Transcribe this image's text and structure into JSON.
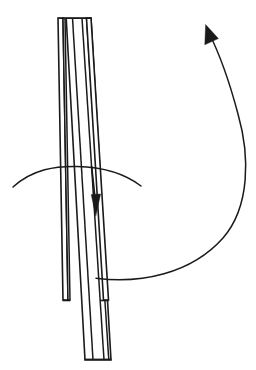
{
  "figure": {
    "background_color": "#ffffff",
    "ink_color": "#1a1a1a",
    "width": 256,
    "height": 370,
    "caption": "",
    "elements": {
      "stack_label": "layered-strip-stack",
      "down_arrow_label": "downward-direction-arrow",
      "horizontal_arc_label": "horizontal-rotation-arc",
      "big_arc_label": "large-curved-rotation-arrow"
    },
    "geometry": {
      "strip_top_y": 18,
      "strip_bottom_y": 360,
      "step_y": 300,
      "outer_left_top_x": 58,
      "outer_left_bottom_x": 63,
      "lines_top_x": [
        58,
        63,
        72.5,
        82,
        86.5,
        91
      ],
      "lines_bottom_x": [
        63,
        68,
        85,
        100.5,
        106,
        111
      ],
      "down_arrow": {
        "x_top": 92,
        "y_top": 166,
        "x_tip": 95,
        "y_tip": 215,
        "head_width": 9,
        "head_length": 20
      },
      "horizontal_arc": {
        "x_start": 13,
        "y_start": 187,
        "x_end": 141,
        "y_end": 186,
        "apex_y": 167
      },
      "big_arc": {
        "x_start": 96,
        "y_start": 278,
        "x_tip": 206,
        "y_tip": 25,
        "max_x": 248,
        "head_width": 11,
        "head_length": 22
      }
    },
    "stroke_widths": {
      "outline": 1.6,
      "inner_line": 1.5,
      "arc": 1.5,
      "arrow_shaft": 1.6
    }
  }
}
